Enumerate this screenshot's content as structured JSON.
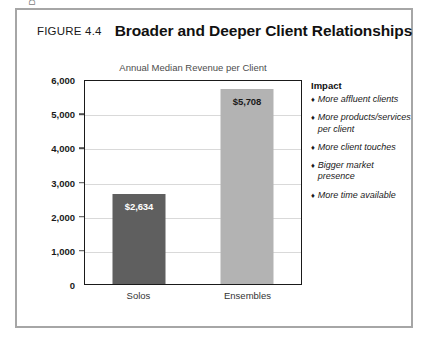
{
  "figure": {
    "number_label": "FIGURE 4.4",
    "title": "Broader and Deeper Client Relationships",
    "frame_color": "#a6a6a6"
  },
  "chart_data": {
    "type": "bar",
    "title": "Annual Median Revenue per Client",
    "xlabel": "",
    "ylabel": "Dollars",
    "ylim": [
      0,
      6000
    ],
    "ytick_values": [
      0,
      1000,
      2000,
      3000,
      4000,
      5000,
      6000
    ],
    "ytick_labels": [
      "0",
      "1,000",
      "2,000",
      "3,000",
      "4,000",
      "5,000",
      "6,000"
    ],
    "grid": true,
    "legend": "none",
    "categories": [
      "Solos",
      "Ensembles"
    ],
    "values": [
      2634,
      5708
    ],
    "data_labels": [
      "$2,634",
      "$5,708"
    ],
    "bar_colors": [
      "#5f5f5f",
      "#b3b3b3"
    ],
    "bar_label_colors": [
      "#ffffff",
      "#1a1a1a"
    ]
  },
  "impact": {
    "heading": "Impact",
    "bullet_glyph": "♦",
    "items": [
      "More affluent clients",
      "More products/services per client",
      "More client touches",
      "Bigger market presence",
      "More time available"
    ]
  }
}
